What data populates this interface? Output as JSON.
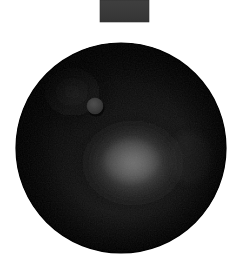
{
  "canvas": {
    "width": 240,
    "height": 275,
    "background_color": "#ffffff",
    "description": "Dark matte sphere (black squash ball) on plain white background with a small gray tab at top edge"
  },
  "objects": {
    "top_tab": {
      "name": "gray-rectangle-tab",
      "x": 100,
      "y": 0,
      "width": 49,
      "height": 22,
      "color": "#3a3a3a",
      "edge_color": "#464646"
    },
    "ball": {
      "name": "black-ball",
      "center_x": 121,
      "center_y": 148,
      "radius": 105,
      "base_color": "#0a0a0a",
      "rim_color": "#050505",
      "mid_tone": "#2a2a2a",
      "shadow_color": "#000000"
    },
    "highlight": {
      "name": "specular-highlight",
      "center_x": 133,
      "center_y": 163,
      "radius_x": 62,
      "radius_y": 52,
      "peak_color": "#6e6e6e",
      "mid_color": "#3c3c3c",
      "falloff_color": "#111111"
    },
    "secondary_sheen": {
      "name": "upper-left-sheen",
      "center_x": 72,
      "center_y": 92,
      "radius_x": 48,
      "radius_y": 42,
      "peak_color": "#242424",
      "falloff_color": "#0a0a0a"
    },
    "logo_dot": {
      "name": "ball-logo-dot",
      "center_x": 95,
      "center_y": 106,
      "radius": 8,
      "fill_color": "#3c3c3c",
      "edge_color": "#4a4a4a",
      "shadow_color": "#000000"
    }
  },
  "labels": {
    "alt_text": "A black rubber ball with a small round gray dot marking, lit from the lower center, against a white background",
    "scene_title": "Black ball on white background"
  }
}
